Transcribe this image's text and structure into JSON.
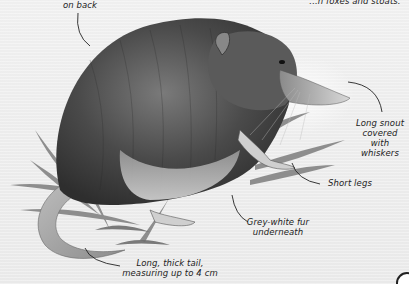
{
  "diagram": {
    "callouts": [
      {
        "id": "fur-back",
        "text": "on back"
      },
      {
        "id": "predators",
        "text": "...n foxes and stoats."
      },
      {
        "id": "snout",
        "lines": [
          "Long snout",
          "covered with",
          "whiskers"
        ]
      },
      {
        "id": "legs",
        "text": "Short legs"
      },
      {
        "id": "fur-under",
        "lines": [
          "Grey-white fur",
          "underneath"
        ]
      },
      {
        "id": "tail",
        "lines": [
          "Long, thick tail,",
          "measuring up to 4 cm"
        ]
      }
    ]
  },
  "colors": {
    "background": "#eeeeee",
    "fur_dark": "#3a3a3a",
    "fur_mid": "#6e6e6e",
    "fur_light": "#c8c8c8",
    "leaf": "#7a7a7a",
    "ink": "#222222"
  }
}
